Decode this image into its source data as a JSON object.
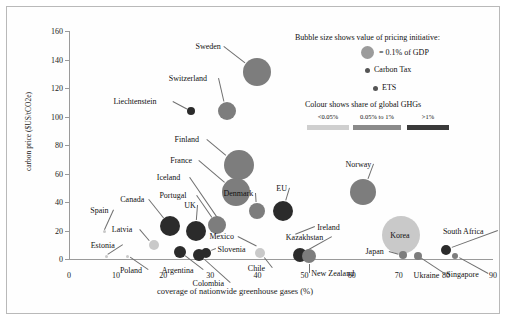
{
  "chart_data": {
    "type": "scatter",
    "title": "",
    "xlabel": "coverage of nationwide greenhouse gases (%)",
    "ylabel": "carbon price ($US/tCO2e)",
    "xlim": [
      0,
      90
    ],
    "ylim": [
      0,
      160
    ],
    "xticks": [
      0,
      10,
      20,
      30,
      40,
      50,
      60,
      70,
      80,
      90
    ],
    "yticks": [
      0,
      20,
      40,
      60,
      80,
      100,
      120,
      140,
      160
    ],
    "grid": false,
    "legend_position": "top-right",
    "size_encoding": "Bubble size shows value of pricing initiative (area ~ % of GDP)",
    "colour_encoding": "Colour shows share of global GHGs",
    "points": [
      {
        "name": "Sweden",
        "x": 40.0,
        "y": 131,
        "r": 14.0,
        "shade": "mid",
        "label_dx": -62,
        "label_dy": -26
      },
      {
        "name": "Switzerland",
        "x": 33.5,
        "y": 104,
        "r": 9.0,
        "shade": "mid",
        "label_dx": -58,
        "label_dy": -33
      },
      {
        "name": "Liechtenstein",
        "x": 26.0,
        "y": 104,
        "r": 4.0,
        "shade": "dark",
        "label_dx": -78,
        "label_dy": -10
      },
      {
        "name": "Finland",
        "x": 36.0,
        "y": 66,
        "r": 15.0,
        "shade": "mid",
        "label_dx": -64,
        "label_dy": -26
      },
      {
        "name": "France",
        "x": 35.5,
        "y": 47,
        "r": 14.0,
        "shade": "mid",
        "label_dx": -66,
        "label_dy": -32
      },
      {
        "name": "Denmark",
        "x": 40.0,
        "y": 34,
        "r": 8.0,
        "shade": "mid",
        "label_dx": -34,
        "label_dy": -18
      },
      {
        "name": "EU",
        "x": 45.5,
        "y": 34,
        "r": 10.0,
        "shade": "dark",
        "label_dx": -7,
        "label_dy": -23
      },
      {
        "name": "Iceland",
        "x": 32.0,
        "y": 27,
        "r": 0.0,
        "shade": "mid",
        "label_dx": -63,
        "label_dy": -44
      },
      {
        "name": "Portugal",
        "x": 31.5,
        "y": 24,
        "r": 9.0,
        "shade": "mid",
        "label_dx": -58,
        "label_dy": -30
      },
      {
        "name": "UK",
        "x": 27.0,
        "y": 20,
        "r": 10.0,
        "shade": "dark",
        "label_dx": -12,
        "label_dy": -26
      },
      {
        "name": "Canada",
        "x": 21.5,
        "y": 23,
        "r": 10.0,
        "shade": "dark",
        "label_dx": -50,
        "label_dy": -27
      },
      {
        "name": "Spain",
        "x": 7.5,
        "y": 19,
        "r": 1.5,
        "shade": "light",
        "label_dx": -14,
        "label_dy": -22
      },
      {
        "name": "Latvia",
        "x": 18.0,
        "y": 10,
        "r": 5.0,
        "shade": "light",
        "label_dx": -42,
        "label_dy": -16
      },
      {
        "name": "Estonia",
        "x": 8.0,
        "y": 2,
        "r": 1.5,
        "shade": "light",
        "label_dx": -16,
        "label_dy": -11
      },
      {
        "name": "Poland",
        "x": 12.5,
        "y": 2,
        "r": 1.5,
        "shade": "light",
        "label_dx": -8,
        "label_dy": 14
      },
      {
        "name": "Argentina",
        "x": 23.5,
        "y": 5,
        "r": 6.0,
        "shade": "dark",
        "label_dx": -18,
        "label_dy": 18
      },
      {
        "name": "Colombia",
        "x": 27.5,
        "y": 3,
        "r": 6.0,
        "shade": "dark",
        "label_dx": -6,
        "label_dy": 28
      },
      {
        "name": "Slovenia",
        "x": 29.0,
        "y": 4,
        "r": 5.0,
        "shade": "dark",
        "label_dx": 12,
        "label_dy": -4
      },
      {
        "name": "Chile",
        "x": 40.5,
        "y": 4,
        "r": 5.0,
        "shade": "light",
        "label_dx": -12,
        "label_dy": 15
      },
      {
        "name": "Mexico",
        "x": 40.0,
        "y": 9,
        "r": 0.0,
        "shade": "light",
        "label_dx": -48,
        "label_dy": -10
      },
      {
        "name": "Kazakhstan",
        "x": 49.0,
        "y": 3,
        "r": 7.0,
        "shade": "dark",
        "label_dx": -14,
        "label_dy": -18
      },
      {
        "name": "New Zealand",
        "x": 51.0,
        "y": 2,
        "r": 7.0,
        "shade": "mid",
        "label_dx": 2,
        "label_dy": 17
      },
      {
        "name": "Ireland",
        "x": 48.0,
        "y": 17,
        "r": 0.0,
        "shade": "mid",
        "label_dx": 22,
        "label_dy": -8
      },
      {
        "name": "Norway",
        "x": 62.5,
        "y": 47,
        "r": 13.0,
        "shade": "mid",
        "label_dx": -18,
        "label_dy": -28
      },
      {
        "name": "Korea",
        "x": 70.5,
        "y": 17,
        "r": 19.0,
        "shade": "light",
        "label_dx": -1,
        "label_dy": 0
      },
      {
        "name": "Japan",
        "x": 71.0,
        "y": 3,
        "r": 4.0,
        "shade": "mid",
        "label_dx": -38,
        "label_dy": -4
      },
      {
        "name": "Ukraine",
        "x": 74.0,
        "y": 2,
        "r": 4.0,
        "shade": "mid",
        "label_dx": -4,
        "label_dy": 19
      },
      {
        "name": "South Africa",
        "x": 80.0,
        "y": 6,
        "r": 5.0,
        "shade": "dark",
        "label_dx": -3,
        "label_dy": -19
      },
      {
        "name": "Singapore",
        "x": 82.0,
        "y": 2,
        "r": 3.0,
        "shade": "mid",
        "label_dx": -9,
        "label_dy": 18
      }
    ],
    "shades": {
      "light": "#c9c9c9",
      "mid": "#7d7d7d",
      "dark": "#2b2b2b"
    }
  },
  "legend": {
    "size_title": "Bubble size shows value of pricing initiative:",
    "gdp_label": "= 0.1% of GDP",
    "carbon_tax_label": "Carbon Tax",
    "ets_label": "ETS",
    "colour_title": "Colour shows share of global GHGs",
    "colour_bins": [
      "<0.05%",
      "0.05% to 1%",
      ">1%"
    ],
    "colour_swatches": [
      "#cfcfcf",
      "#8a8a8a",
      "#3a3a3a"
    ]
  }
}
